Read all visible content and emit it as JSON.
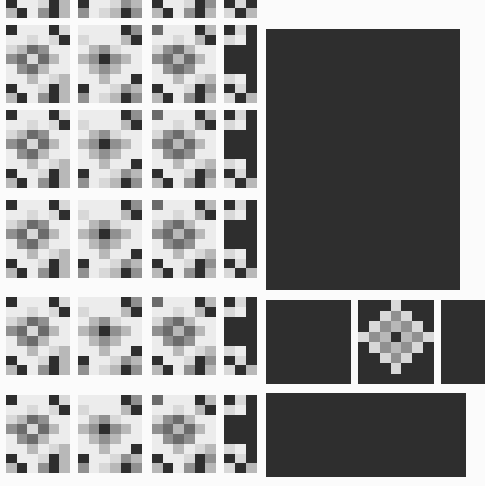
{
  "canvas": {
    "width": 485,
    "height": 486,
    "background": "#fbfbfb"
  },
  "palette": {
    "dark": "#2e2e2e",
    "mid_dark": "#6b6b6b",
    "mid": "#909090",
    "mid_light": "#b8b8b8",
    "light": "#d8d8d8",
    "lightest": "#ececec",
    "near_white": "#f2f2f2"
  },
  "legend": {
    "title": "Mosaic Tile Gallery",
    "note": "grid of pixelated thumbnail tiles with dark placeholder panels"
  },
  "tile_defs": {
    "wide": {
      "cols": 6,
      "rows": 8
    },
    "narrow": {
      "cols": 3,
      "rows": 8
    },
    "diamond": {
      "cols": 7,
      "rows": 8
    }
  },
  "patterns": {
    "A": [
      [
        1,
        6,
        6,
        6,
        1,
        5
      ],
      [
        6,
        6,
        5,
        6,
        5,
        1
      ],
      [
        5,
        4,
        2,
        3,
        6,
        6
      ],
      [
        3,
        2,
        5,
        2,
        4,
        6
      ],
      [
        6,
        3,
        2,
        4,
        6,
        6
      ],
      [
        6,
        6,
        4,
        6,
        5,
        4
      ],
      [
        1,
        6,
        6,
        5,
        1,
        4
      ],
      [
        4,
        1,
        6,
        3,
        1,
        4
      ]
    ],
    "B": [
      [
        6,
        6,
        6,
        6,
        1,
        3
      ],
      [
        5,
        6,
        6,
        6,
        4,
        1
      ],
      [
        6,
        4,
        3,
        5,
        6,
        6
      ],
      [
        4,
        3,
        1,
        3,
        4,
        6
      ],
      [
        6,
        4,
        3,
        4,
        6,
        6
      ],
      [
        6,
        6,
        4,
        6,
        6,
        1
      ],
      [
        1,
        6,
        6,
        5,
        3,
        4
      ],
      [
        3,
        6,
        5,
        4,
        1,
        3
      ]
    ],
    "C": [
      [
        2,
        6,
        6,
        6,
        1,
        4
      ],
      [
        6,
        6,
        5,
        6,
        4,
        1
      ],
      [
        5,
        3,
        2,
        4,
        6,
        6
      ],
      [
        3,
        2,
        4,
        2,
        4,
        6
      ],
      [
        6,
        3,
        2,
        3,
        6,
        6
      ],
      [
        6,
        6,
        4,
        6,
        5,
        4
      ],
      [
        1,
        6,
        6,
        5,
        1,
        3
      ],
      [
        4,
        1,
        6,
        3,
        1,
        4
      ]
    ],
    "N": [
      [
        1,
        5,
        1
      ],
      [
        5,
        6,
        1
      ],
      [
        1,
        1,
        1
      ],
      [
        1,
        1,
        1
      ],
      [
        1,
        1,
        1
      ],
      [
        5,
        6,
        1
      ],
      [
        1,
        5,
        1
      ],
      [
        5,
        1,
        4
      ]
    ],
    "D": [
      [
        1,
        1,
        1,
        5,
        1,
        1,
        1
      ],
      [
        1,
        1,
        5,
        3,
        5,
        1,
        1
      ],
      [
        1,
        5,
        3,
        4,
        3,
        5,
        1
      ],
      [
        5,
        3,
        4,
        1,
        4,
        3,
        5
      ],
      [
        1,
        5,
        3,
        4,
        3,
        5,
        1
      ],
      [
        1,
        1,
        5,
        3,
        5,
        1,
        1
      ],
      [
        1,
        1,
        1,
        5,
        1,
        1,
        1
      ],
      [
        1,
        1,
        1,
        1,
        1,
        1,
        1
      ]
    ]
  },
  "rows": [
    {
      "name": "row-0-clipped",
      "y": -60,
      "height": 78,
      "clipped": true,
      "tiles": [
        {
          "pattern": "A",
          "x": 6,
          "w": 64
        },
        {
          "pattern": "B",
          "x": 78,
          "w": 64
        },
        {
          "pattern": "C",
          "x": 152,
          "w": 64
        },
        {
          "pattern": "N",
          "x": 224,
          "w": 33
        }
      ]
    },
    {
      "name": "row-1",
      "y": 25,
      "height": 78,
      "tiles": [
        {
          "pattern": "A",
          "x": 6,
          "w": 64
        },
        {
          "pattern": "B",
          "x": 78,
          "w": 64
        },
        {
          "pattern": "C",
          "x": 152,
          "w": 64
        },
        {
          "pattern": "N",
          "x": 224,
          "w": 33
        }
      ]
    },
    {
      "name": "row-2",
      "y": 110,
      "height": 78,
      "tiles": [
        {
          "pattern": "A",
          "x": 6,
          "w": 64
        },
        {
          "pattern": "B",
          "x": 78,
          "w": 64
        },
        {
          "pattern": "C",
          "x": 152,
          "w": 64
        },
        {
          "pattern": "N",
          "x": 224,
          "w": 33
        }
      ]
    },
    {
      "name": "row-3",
      "y": 200,
      "height": 78,
      "tiles": [
        {
          "pattern": "A",
          "x": 6,
          "w": 64
        },
        {
          "pattern": "B",
          "x": 78,
          "w": 64
        },
        {
          "pattern": "C",
          "x": 152,
          "w": 64
        },
        {
          "pattern": "N",
          "x": 224,
          "w": 33
        }
      ]
    },
    {
      "name": "row-4",
      "y": 297,
      "height": 78,
      "tiles": [
        {
          "pattern": "A",
          "x": 6,
          "w": 64
        },
        {
          "pattern": "B",
          "x": 78,
          "w": 64
        },
        {
          "pattern": "C",
          "x": 152,
          "w": 64
        },
        {
          "pattern": "N",
          "x": 224,
          "w": 33
        }
      ]
    },
    {
      "name": "row-5",
      "y": 395,
      "height": 78,
      "tiles": [
        {
          "pattern": "A",
          "x": 6,
          "w": 64
        },
        {
          "pattern": "B",
          "x": 78,
          "w": 64
        },
        {
          "pattern": "C",
          "x": 152,
          "w": 64
        },
        {
          "pattern": "N",
          "x": 224,
          "w": 33
        }
      ]
    }
  ],
  "panels": [
    {
      "name": "panel-large-main",
      "x": 266,
      "y": 29,
      "w": 194,
      "h": 261
    },
    {
      "name": "panel-small-left",
      "x": 266,
      "y": 300,
      "w": 85,
      "h": 84
    },
    {
      "name": "panel-small-right",
      "x": 441,
      "y": 300,
      "w": 44,
      "h": 84
    },
    {
      "name": "panel-wide-bottom",
      "x": 266,
      "y": 393,
      "w": 200,
      "h": 84
    }
  ],
  "diamond_tile": {
    "name": "tile-diamond",
    "x": 358,
    "y": 300,
    "w": 76,
    "h": 84,
    "pattern": "D"
  }
}
